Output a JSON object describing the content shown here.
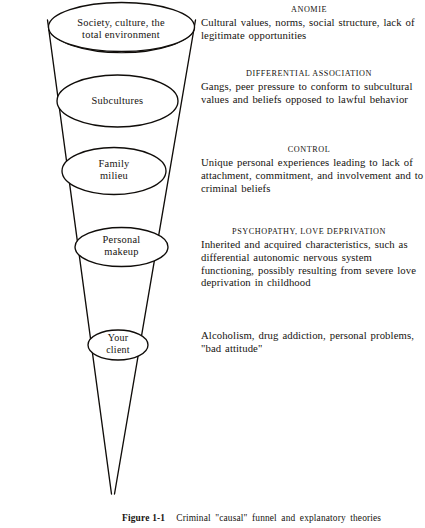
{
  "figure": {
    "caption_number": "Figure 1-1",
    "caption_text": "Criminal \"causal\" funnel and explanatory theories"
  },
  "funnel": {
    "levels": [
      {
        "id": "society",
        "label": "Society, culture, the\ntotal environment"
      },
      {
        "id": "subcultures",
        "label": "Subcultures"
      },
      {
        "id": "family",
        "label": "Family\nmilieu"
      },
      {
        "id": "personal",
        "label": "Personal\nmakeup"
      },
      {
        "id": "client",
        "label": "Your\nclient"
      }
    ]
  },
  "theories": [
    {
      "id": "anomie",
      "heading": "ANOMIE",
      "body": "Cultural values, norms, social structure, lack of legitimate opportunities"
    },
    {
      "id": "differential-association",
      "heading": "DIFFERENTIAL ASSOCIATION",
      "body": "Gangs, peer pressure to conform to subcultural values and beliefs opposed to lawful behavior"
    },
    {
      "id": "control",
      "heading": "CONTROL",
      "body": "Unique personal experiences leading to lack of attachment, commitment, and involvement and to criminal beliefs"
    },
    {
      "id": "psychopathy",
      "heading": "PSYCHOPATHY, LOVE DEPRIVATION",
      "body": "Inherited and acquired characteristics, such as differential autonomic nervous system functioning, possibly resulting from severe love deprivation in childhood"
    },
    {
      "id": "client-problems",
      "heading": "",
      "body": "Alcoholism, drug addiction, personal problems, \"bad attitude\""
    }
  ],
  "colors": {
    "ink": "#16130f",
    "paper": "#ffffff"
  }
}
